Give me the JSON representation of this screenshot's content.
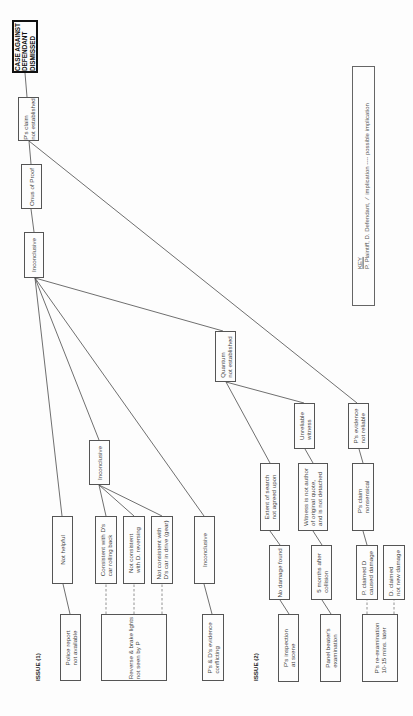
{
  "diagram": {
    "orientation": "rotated -90deg (reads bottom-to-top)",
    "issues": {
      "issue1_label": "ISSUE (1)",
      "issue2_label": "ISSUE (2)"
    },
    "nodes": {
      "case_dismissed": "CASE AGAINST\nDEFENDANT\nDISMISSED",
      "p_claim_not_established": "P's claim\nnot established",
      "onus_of_proof": "Onus of Proof",
      "inconclusive_top": "Inconclusive",
      "inconclusive_mid": "Inconclusive",
      "not_helpful": "Not helpful",
      "consistent_rolling_back": "Consistent with D's\ncar rolling back",
      "not_consistent_reversing": "Not consistent\nwith D. reversing",
      "not_consistent_drive": "Not consistent with\nD's car in drive (gear)",
      "inconclusive_right": "Inconclusive",
      "police_report": "Police report\nnot available",
      "reverse_brake_lights": "Reverse & brake lights\nnot seen by P",
      "p_d_evidence_conflicting": "P's & D's evidence\nconflicting",
      "quantum_not_established": "Quantum\nnot established",
      "unreliable_witness": "Unreliable\nwitness",
      "p_evidence_not_reliable": "P's evidence\nnot reliable",
      "extent_of_search": "Extent of search\nnot agreed upon",
      "witness_not_author": "Witness is not author\nof original quote,\nand is not detached",
      "p_claim_nonsensical": "P's claim\nnonsensical",
      "no_damage_found": "No damage found",
      "five_months_after": "5 months after\ncollision",
      "p_claimed_d_caused": "P. claimed D\ncaused damage",
      "d_claimed_not_new": "D. claimed\nnot new damage",
      "p_inspection_scene": "P's inspection\nat scene",
      "panel_beater_exam": "Panel beater's\nexamination",
      "p_re_examination": "P's re-examination\n10-15 mins. later"
    },
    "key": {
      "title": "KEY",
      "line1": "P. Plaintiff, D. Defendant,  ⁄  implication ---- possible implication"
    },
    "edges": [
      {
        "from": "p_claim_not_established",
        "to": "case_dismissed",
        "style": "solid"
      },
      {
        "from": "onus_of_proof",
        "to": "p_claim_not_established",
        "style": "solid"
      },
      {
        "from": "inconclusive_top",
        "to": "onus_of_proof",
        "style": "solid"
      },
      {
        "from": "p_evidence_not_reliable",
        "to": "p_claim_not_established",
        "style": "solid"
      },
      {
        "from": "quantum_not_established",
        "to": "inconclusive_top",
        "style": "solid"
      },
      {
        "from": "not_helpful",
        "to": "inconclusive_top",
        "style": "solid"
      },
      {
        "from": "inconclusive_mid",
        "to": "inconclusive_top",
        "style": "solid"
      },
      {
        "from": "inconclusive_right",
        "to": "inconclusive_top",
        "style": "solid"
      },
      {
        "from": "consistent_rolling_back",
        "to": "inconclusive_mid",
        "style": "solid"
      },
      {
        "from": "not_consistent_reversing",
        "to": "inconclusive_mid",
        "style": "solid"
      },
      {
        "from": "not_consistent_drive",
        "to": "inconclusive_mid",
        "style": "solid"
      },
      {
        "from": "police_report",
        "to": "not_helpful",
        "style": "solid"
      },
      {
        "from": "reverse_brake_lights",
        "to": "consistent_rolling_back",
        "style": "dashed"
      },
      {
        "from": "reverse_brake_lights",
        "to": "not_consistent_reversing",
        "style": "dashed"
      },
      {
        "from": "reverse_brake_lights",
        "to": "not_consistent_drive",
        "style": "dashed"
      },
      {
        "from": "p_d_evidence_conflicting",
        "to": "inconclusive_right",
        "style": "solid"
      },
      {
        "from": "extent_of_search",
        "to": "quantum_not_established",
        "style": "solid"
      },
      {
        "from": "unreliable_witness",
        "to": "quantum_not_established",
        "style": "solid"
      },
      {
        "from": "witness_not_author",
        "to": "unreliable_witness",
        "style": "solid"
      },
      {
        "from": "p_claim_nonsensical",
        "to": "p_evidence_not_reliable",
        "style": "solid"
      },
      {
        "from": "no_damage_found",
        "to": "extent_of_search",
        "style": "solid"
      },
      {
        "from": "five_months_after",
        "to": "witness_not_author",
        "style": "solid"
      },
      {
        "from": "p_claimed_d_caused",
        "to": "p_claim_nonsensical",
        "style": "solid"
      },
      {
        "from": "p_inspection_scene",
        "to": "no_damage_found",
        "style": "solid"
      },
      {
        "from": "panel_beater_exam",
        "to": "five_months_after",
        "style": "solid"
      },
      {
        "from": "p_re_examination",
        "to": "p_claimed_d_caused",
        "style": "dashed"
      },
      {
        "from": "p_re_examination",
        "to": "d_claimed_not_new",
        "style": "dashed"
      }
    ]
  }
}
